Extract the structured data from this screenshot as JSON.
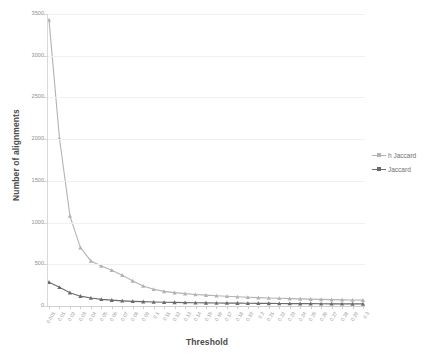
{
  "chart_data": {
    "type": "line",
    "title": "",
    "xlabel": "Threshold",
    "ylabel": "Number of alignments",
    "ylim": [
      0,
      3500
    ],
    "yticks": [
      0,
      500,
      1000,
      1500,
      2000,
      2500,
      3000,
      3500
    ],
    "grid": true,
    "legend_position": "right",
    "x": [
      "0.001",
      "0.01",
      "0.02",
      "0.03",
      "0.04",
      "0.05",
      "0.06",
      "0.07",
      "0.08",
      "0.09",
      "0.1",
      "0.11",
      "0.12",
      "0.13",
      "0.14",
      "0.15",
      "0.16",
      "0.17",
      "0.18",
      "0.19",
      "0.2",
      "0.21",
      "0.22",
      "0.23",
      "0.24",
      "0.25",
      "0.26",
      "0.27",
      "0.28",
      "0.29",
      "0.3"
    ],
    "series": [
      {
        "name": "h Jaccard",
        "color": "#b3b3b3",
        "marker": "triangle",
        "values": [
          3430,
          2010,
          1080,
          700,
          540,
          480,
          430,
          370,
          300,
          240,
          200,
          175,
          160,
          148,
          138,
          130,
          122,
          116,
          110,
          105,
          100,
          96,
          92,
          88,
          85,
          82,
          79,
          76,
          74,
          72,
          70
        ]
      },
      {
        "name": "Jaccard",
        "color": "#6b6b6b",
        "marker": "triangle",
        "values": [
          285,
          225,
          160,
          118,
          95,
          80,
          70,
          62,
          56,
          52,
          48,
          45,
          43,
          41,
          39,
          37,
          36,
          35,
          34,
          33,
          32,
          31,
          30,
          29,
          28,
          28,
          27,
          26,
          26,
          25,
          25
        ]
      }
    ],
    "legend": [
      "h Jaccard",
      "Jaccard"
    ],
    "colors": {
      "series1": "#b3b3b3",
      "series2": "#6b6b6b",
      "grid": "#f0f0f0",
      "axis": "#d9d9d9",
      "text": "#8e8e8e",
      "title_text": "#4a4a4a"
    }
  }
}
